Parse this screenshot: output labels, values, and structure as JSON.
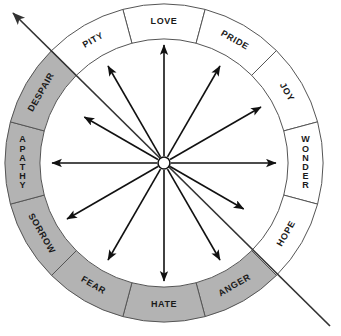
{
  "diagram": {
    "type": "radial-wheel",
    "center": {
      "x": 164,
      "y": 163
    },
    "outer_radius": 159,
    "inner_radius": 124,
    "segment_count": 12,
    "segment_span_degrees": 30,
    "colors": {
      "shaded_fill": "#b3b3b3",
      "unshaded_fill": "#ffffff",
      "stroke": "#555555",
      "text": "#1a1a1a",
      "arrow": "#111111",
      "axis_line": "#333333"
    },
    "segments": [
      {
        "label": "LOVE",
        "shaded": false,
        "start_deg": -105,
        "end_deg": -75,
        "orientation": "tangential",
        "stacked": false
      },
      {
        "label": "PRIDE",
        "shaded": false,
        "start_deg": -75,
        "end_deg": -45,
        "orientation": "tangential",
        "stacked": false
      },
      {
        "label": "JOY",
        "shaded": false,
        "start_deg": -45,
        "end_deg": -15,
        "orientation": "tangential",
        "stacked": false
      },
      {
        "label": "WONDER",
        "shaded": false,
        "start_deg": -15,
        "end_deg": 15,
        "orientation": "stacked",
        "stacked": true
      },
      {
        "label": "HOPE",
        "shaded": false,
        "start_deg": 15,
        "end_deg": 45,
        "orientation": "tangential",
        "stacked": false
      },
      {
        "label": "ANGER",
        "shaded": true,
        "start_deg": 45,
        "end_deg": 75,
        "orientation": "tangential",
        "stacked": false
      },
      {
        "label": "HATE",
        "shaded": true,
        "start_deg": 75,
        "end_deg": 105,
        "orientation": "tangential",
        "stacked": false
      },
      {
        "label": "FEAR",
        "shaded": true,
        "start_deg": 105,
        "end_deg": 135,
        "orientation": "tangential",
        "stacked": false
      },
      {
        "label": "SORROW",
        "shaded": true,
        "start_deg": 135,
        "end_deg": 165,
        "orientation": "tangential",
        "stacked": false
      },
      {
        "label": "APATHY",
        "shaded": true,
        "start_deg": 165,
        "end_deg": 195,
        "orientation": "stacked",
        "stacked": true
      },
      {
        "label": "DESPAIR",
        "shaded": true,
        "start_deg": 195,
        "end_deg": 225,
        "orientation": "tangential",
        "stacked": false
      },
      {
        "label": "PITY",
        "shaded": false,
        "start_deg": 225,
        "end_deg": 255,
        "orientation": "tangential",
        "stacked": false
      }
    ],
    "shaded_labels": [
      "DESPAIR",
      "APATHY",
      "SORROW",
      "FEAR",
      "HATE",
      "ANGER"
    ],
    "unshaded_labels": [
      "PITY",
      "LOVE",
      "PRIDE",
      "JOY",
      "WONDER",
      "HOPE"
    ],
    "axis_line": {
      "from": {
        "x": 330,
        "y": 326
      },
      "to": {
        "x": 13,
        "y": 13
      },
      "arrowhead_at": "upper-left",
      "description": "diagonal dividing axis"
    },
    "center_hub": {
      "radius": 6
    },
    "arrows": {
      "count": 12,
      "angles_deg": [
        -90,
        -60,
        -30,
        0,
        30,
        60,
        90,
        120,
        150,
        180,
        210,
        240
      ],
      "lengths": [
        118,
        112,
        112,
        112,
        92,
        112,
        118,
        112,
        112,
        112,
        92,
        112
      ]
    }
  }
}
